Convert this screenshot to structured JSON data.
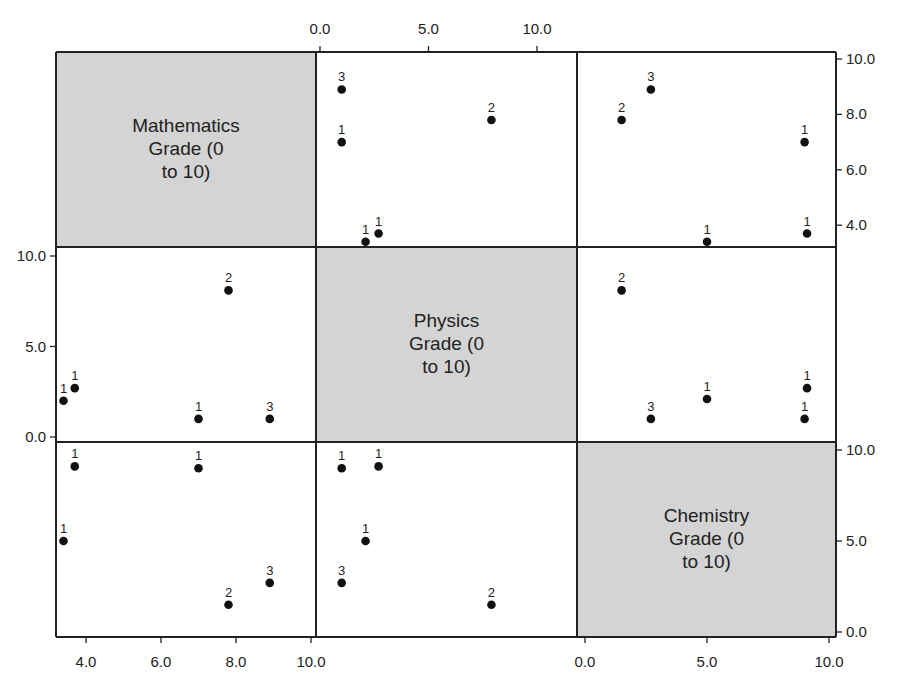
{
  "chart_data": {
    "type": "scatter",
    "subtype": "scatterplot-matrix",
    "title": "",
    "variables": [
      "Mathematics Grade (0 to 10)",
      "Physics Grade (0 to 10)",
      "Chemistry Grade (0 to 10)"
    ],
    "diagonal_labels": [
      [
        "Mathematics",
        "Grade (0",
        "to 10)"
      ],
      [
        "Physics",
        "Grade (0",
        "to 10)"
      ],
      [
        "Chemistry",
        "Grade (0",
        "to 10)"
      ]
    ],
    "axes": {
      "mathematics": {
        "ticks": [
          "4.0",
          "6.0",
          "8.0",
          "10.0"
        ],
        "bottom_ticks": [
          "4.0",
          "6.0",
          "8.0",
          "10.0"
        ],
        "right_ticks": [
          "4.0",
          "6.0",
          "8.0",
          "10.0"
        ],
        "range": [
          3.4,
          10.0
        ]
      },
      "physics": {
        "top_ticks": [
          "0.0",
          "5.0",
          "10.0"
        ],
        "left_ticks": [
          "0.0",
          "5.0",
          "10.0"
        ],
        "range": [
          0,
          10
        ]
      },
      "chemistry": {
        "bottom_ticks": [
          "0.0",
          "5.0",
          "10.0"
        ],
        "right_ticks": [
          "0.0",
          "5.0",
          "10.0"
        ],
        "range": [
          0,
          10
        ]
      }
    },
    "panels": [
      {
        "row": 0,
        "col": 1,
        "x": "Physics",
        "y": "Mathematics",
        "points": [
          {
            "x": 1.0,
            "y": 8.9,
            "label": "3"
          },
          {
            "x": 1.0,
            "y": 7.0,
            "label": "1"
          },
          {
            "x": 2.1,
            "y": 3.4,
            "label": "1"
          },
          {
            "x": 2.7,
            "y": 3.7,
            "label": "1"
          },
          {
            "x": 7.9,
            "y": 7.8,
            "label": "2"
          }
        ]
      },
      {
        "row": 0,
        "col": 2,
        "x": "Chemistry",
        "y": "Mathematics",
        "points": [
          {
            "x": 2.7,
            "y": 8.9,
            "label": "3"
          },
          {
            "x": 1.5,
            "y": 7.8,
            "label": "2"
          },
          {
            "x": 9.0,
            "y": 7.0,
            "label": "1"
          },
          {
            "x": 5.0,
            "y": 3.4,
            "label": "1"
          },
          {
            "x": 9.1,
            "y": 3.7,
            "label": "1"
          }
        ]
      },
      {
        "row": 1,
        "col": 0,
        "x": "Mathematics",
        "y": "Physics",
        "points": [
          {
            "x": 3.4,
            "y": 2.0,
            "label": "1"
          },
          {
            "x": 3.7,
            "y": 2.7,
            "label": "1"
          },
          {
            "x": 7.0,
            "y": 1.0,
            "label": "1"
          },
          {
            "x": 7.8,
            "y": 8.1,
            "label": "2"
          },
          {
            "x": 8.9,
            "y": 1.0,
            "label": "3"
          }
        ]
      },
      {
        "row": 1,
        "col": 2,
        "x": "Chemistry",
        "y": "Physics",
        "points": [
          {
            "x": 1.5,
            "y": 8.1,
            "label": "2"
          },
          {
            "x": 2.7,
            "y": 1.0,
            "label": "3"
          },
          {
            "x": 5.0,
            "y": 2.1,
            "label": "1"
          },
          {
            "x": 9.1,
            "y": 2.7,
            "label": "1"
          },
          {
            "x": 9.0,
            "y": 1.0,
            "label": "1"
          }
        ]
      },
      {
        "row": 2,
        "col": 0,
        "x": "Mathematics",
        "y": "Chemistry",
        "points": [
          {
            "x": 3.7,
            "y": 9.1,
            "label": "1"
          },
          {
            "x": 7.0,
            "y": 9.0,
            "label": "1"
          },
          {
            "x": 3.4,
            "y": 5.0,
            "label": "1"
          },
          {
            "x": 8.9,
            "y": 2.7,
            "label": "3"
          },
          {
            "x": 7.8,
            "y": 1.5,
            "label": "2"
          }
        ]
      },
      {
        "row": 2,
        "col": 1,
        "x": "Physics",
        "y": "Chemistry",
        "points": [
          {
            "x": 1.0,
            "y": 9.0,
            "label": "1"
          },
          {
            "x": 2.7,
            "y": 9.1,
            "label": "1"
          },
          {
            "x": 2.1,
            "y": 5.0,
            "label": "1"
          },
          {
            "x": 1.0,
            "y": 2.7,
            "label": "3"
          },
          {
            "x": 7.9,
            "y": 1.5,
            "label": "2"
          }
        ]
      }
    ],
    "point_label_meaning": "count of overlapping observations",
    "grid": false,
    "legend": null,
    "colors": {
      "diagonal_fill": "#d4d4d4",
      "point": "#111111",
      "border": "#222222"
    }
  }
}
